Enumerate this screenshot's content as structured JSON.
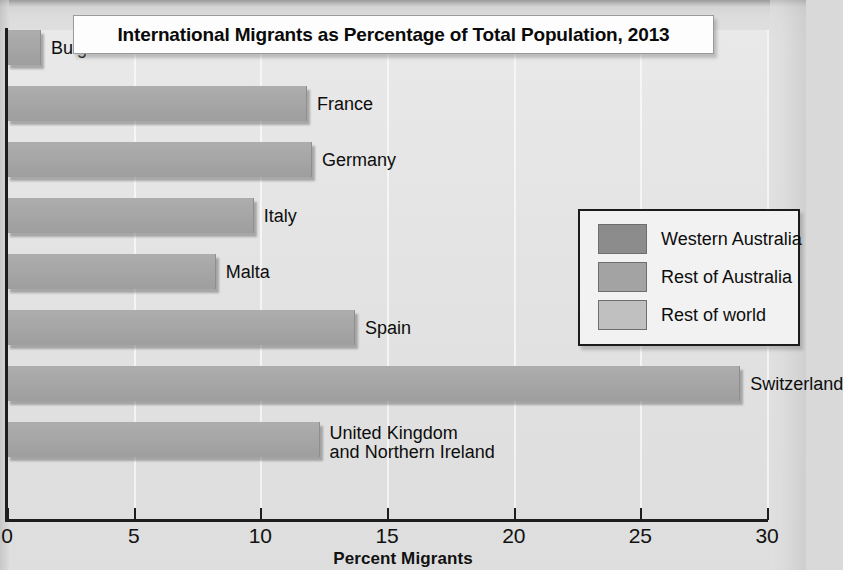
{
  "chart_data": {
    "type": "bar",
    "orientation": "horizontal",
    "title": "International Migrants as Percentage of Total Population, 2013",
    "xlabel": "Percent Migrants",
    "ylabel": "",
    "xlim": [
      0,
      30
    ],
    "xticks": [
      0,
      5,
      10,
      15,
      20,
      25,
      30
    ],
    "xtick_labels": [
      "0",
      "5",
      "10",
      "15",
      "20",
      "25",
      "30"
    ],
    "grid": true,
    "grid_axis": "x",
    "legend_position": "right",
    "categories": [
      "Bulgaria",
      "France",
      "Germany",
      "Italy",
      "Malta",
      "Spain",
      "Switzerland",
      "United Kingdom\nand Northern Ireland"
    ],
    "values": [
      1.3,
      11.8,
      12.0,
      9.7,
      8.2,
      13.7,
      28.9,
      12.3
    ],
    "series": [
      {
        "name": "Rest of world",
        "values": [
          1.3,
          11.8,
          12.0,
          9.7,
          8.2,
          13.7,
          28.9,
          12.3
        ]
      }
    ],
    "legend_entries": [
      "Western Australia",
      "Rest of Australia",
      "Rest of world"
    ],
    "bar_color": "#a6a6a6",
    "plot_background": "#e4e4e4",
    "axis_color": "#1d1d1d"
  },
  "title": {
    "text": "International Migrants as Percentage of Total Population, 2013"
  },
  "axis": {
    "x_title": "Percent Migrants",
    "ticks": [
      {
        "value": 0,
        "label": "0"
      },
      {
        "value": 5,
        "label": "5"
      },
      {
        "value": 10,
        "label": "10"
      },
      {
        "value": 15,
        "label": "15"
      },
      {
        "value": 20,
        "label": "20"
      },
      {
        "value": 25,
        "label": "25"
      },
      {
        "value": 30,
        "label": "30"
      }
    ]
  },
  "bars": [
    {
      "label": "Bulgaria",
      "value": 1.3,
      "label_line1": "Bulgaria",
      "label_line2": ""
    },
    {
      "label": "France",
      "value": 11.8,
      "label_line1": "France",
      "label_line2": ""
    },
    {
      "label": "Germany",
      "value": 12.0,
      "label_line1": "Germany",
      "label_line2": ""
    },
    {
      "label": "Italy",
      "value": 9.7,
      "label_line1": "Italy",
      "label_line2": ""
    },
    {
      "label": "Malta",
      "value": 8.2,
      "label_line1": "Malta",
      "label_line2": ""
    },
    {
      "label": "Spain",
      "value": 13.7,
      "label_line1": "Spain",
      "label_line2": ""
    },
    {
      "label": "Switzerland",
      "value": 28.9,
      "label_line1": "Switzerland",
      "label_line2": ""
    },
    {
      "label": "United Kingdom and Northern Ireland",
      "value": 12.3,
      "label_line1": "United Kingdom",
      "label_line2": "and Northern Ireland"
    }
  ],
  "legend": {
    "items": [
      {
        "label": "Western Australia",
        "color": "#8c8c8c"
      },
      {
        "label": "Rest of Australia",
        "color": "#a3a3a3"
      },
      {
        "label": "Rest of world",
        "color": "#c0c0c0"
      }
    ]
  }
}
